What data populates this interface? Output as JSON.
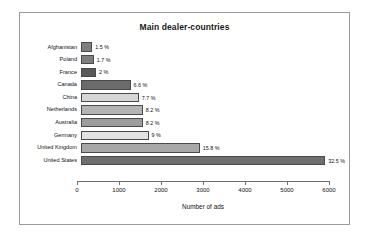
{
  "chart_data": {
    "type": "bar",
    "orientation": "horizontal",
    "title": "Main dealer-countries",
    "xlabel": "Number of ads",
    "ylabel": "",
    "xlim": [
      0,
      6000
    ],
    "xticks": [
      0,
      1000,
      2000,
      3000,
      4000,
      5000,
      6000
    ],
    "xtick_labels": [
      "0",
      "1000",
      "2000",
      "3000",
      "4000",
      "5000",
      "6000"
    ],
    "grid": false,
    "legend": false,
    "categories": [
      "Afghanistan",
      "Poland",
      "France",
      "Canada",
      "China",
      "Netherlands",
      "Australia",
      "Germany",
      "United Kingdom",
      "United States"
    ],
    "values": [
      250,
      285,
      335,
      1100,
      1285,
      1370,
      1370,
      1500,
      2640,
      5430
    ],
    "data_labels": [
      "1.5 %",
      "1.7 %",
      "2 %",
      "6.6 %",
      "7.7 %",
      "8.2 %",
      "8.2 %",
      "9 %",
      "15.8 %",
      "32.5 %"
    ],
    "percentages": [
      1.5,
      1.7,
      2,
      6.6,
      7.7,
      8.2,
      8.2,
      9,
      15.8,
      32.5
    ],
    "bar_colors": [
      "#7f7f7f",
      "#7f7f7f",
      "#595959",
      "#6b6b6b",
      "#d6d6d6",
      "#b4b4b4",
      "#9d9d9d",
      "#e2e2e2",
      "#a8a8a8",
      "#6e6e6e"
    ],
    "bar_edge_color": "#4a4a4a"
  },
  "frame": {
    "border_color": "#9a9a9a",
    "background": "#ffffff"
  }
}
